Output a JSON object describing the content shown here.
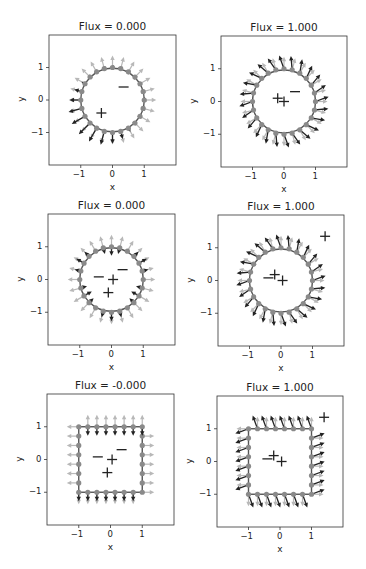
{
  "figure": {
    "background": "#ffffff",
    "colors": {
      "axes_frame": "#333333",
      "node": "#8a8a8a",
      "curve": "#555555",
      "arrow_dark": "#222222",
      "arrow_light": "#b8b8b8",
      "marker": "#222222"
    }
  },
  "chart_data": [
    {
      "type": "quiver",
      "title": "Flux = 0.000",
      "xlabel": "x",
      "ylabel": "y",
      "xlim": [
        -2,
        2
      ],
      "ylim": [
        -2,
        2
      ],
      "xticks": [
        -1,
        0,
        1
      ],
      "yticks": [
        -1,
        0,
        1
      ],
      "shape": "circle",
      "n_nodes": 24,
      "charges": [
        {
          "sign": "-",
          "x": 0.35,
          "y": 0.4
        },
        {
          "sign": "+",
          "x": -0.35,
          "y": -0.4
        }
      ],
      "flow": "dipole"
    },
    {
      "type": "quiver",
      "title": "Flux = 1.000",
      "xlabel": "x",
      "ylabel": "y",
      "xlim": [
        -2,
        2
      ],
      "ylim": [
        -2,
        2
      ],
      "xticks": [
        -1,
        0,
        1
      ],
      "yticks": [
        -1,
        0,
        1
      ],
      "shape": "circle",
      "n_nodes": 24,
      "charges": [
        {
          "sign": "-",
          "x": 0.35,
          "y": 0.3
        },
        {
          "sign": "+",
          "x": -0.2,
          "y": 0.1
        },
        {
          "sign": "+",
          "x": 0.0,
          "y": 0.0
        }
      ],
      "flow": "outward"
    },
    {
      "type": "quiver",
      "title": "Flux = 0.000",
      "xlabel": "x",
      "ylabel": "y",
      "xlim": [
        -2,
        2
      ],
      "ylim": [
        -2,
        2
      ],
      "xticks": [
        -1,
        0,
        1
      ],
      "yticks": [
        -1,
        0,
        1
      ],
      "shape": "circle",
      "n_nodes": 24,
      "charges": [
        {
          "sign": "-",
          "x": 0.35,
          "y": 0.3
        },
        {
          "sign": "-",
          "x": -0.4,
          "y": 0.08
        },
        {
          "sign": "+",
          "x": 0.05,
          "y": 0.0
        },
        {
          "sign": "+",
          "x": -0.1,
          "y": -0.4
        }
      ],
      "flow": "mixed"
    },
    {
      "type": "quiver",
      "title": "Flux = 1.000",
      "xlabel": "x",
      "ylabel": "y",
      "xlim": [
        -2,
        2
      ],
      "ylim": [
        -2,
        2
      ],
      "xticks": [
        -1,
        0,
        1
      ],
      "yticks": [
        -1,
        0,
        1
      ],
      "shape": "circle",
      "n_nodes": 24,
      "charges": [
        {
          "sign": "-",
          "x": -0.4,
          "y": 0.08
        },
        {
          "sign": "+",
          "x": -0.2,
          "y": 0.18
        },
        {
          "sign": "+",
          "x": 0.05,
          "y": 0.0
        },
        {
          "sign": "+",
          "x": 1.4,
          "y": 1.35
        }
      ],
      "flow": "outward"
    },
    {
      "type": "quiver",
      "title": "Flux = -0.000",
      "xlabel": "x",
      "ylabel": "y",
      "xlim": [
        -2,
        2
      ],
      "ylim": [
        -2,
        2
      ],
      "xticks": [
        -1,
        0,
        1
      ],
      "yticks": [
        -1,
        0,
        1
      ],
      "shape": "square",
      "n_nodes": 28,
      "charges": [
        {
          "sign": "-",
          "x": 0.35,
          "y": 0.3
        },
        {
          "sign": "-",
          "x": -0.4,
          "y": 0.08
        },
        {
          "sign": "+",
          "x": 0.05,
          "y": 0.0
        },
        {
          "sign": "+",
          "x": -0.1,
          "y": -0.4
        }
      ],
      "flow": "mixed"
    },
    {
      "type": "quiver",
      "title": "Flux = 1.000",
      "xlabel": "x",
      "ylabel": "y",
      "xlim": [
        -2,
        2
      ],
      "ylim": [
        -2,
        2
      ],
      "xticks": [
        -1,
        0,
        1
      ],
      "yticks": [
        -1,
        0,
        1
      ],
      "shape": "square",
      "n_nodes": 28,
      "charges": [
        {
          "sign": "-",
          "x": -0.4,
          "y": 0.08
        },
        {
          "sign": "+",
          "x": -0.2,
          "y": 0.18
        },
        {
          "sign": "+",
          "x": 0.05,
          "y": 0.0
        },
        {
          "sign": "+",
          "x": 1.4,
          "y": 1.35
        }
      ],
      "flow": "outward"
    }
  ],
  "layout": {
    "axes_boxes": [
      {
        "left": 49,
        "top": 35,
        "w": 127,
        "h": 130
      },
      {
        "left": 221,
        "top": 36,
        "w": 126,
        "h": 131
      },
      {
        "left": 48,
        "top": 214,
        "w": 127,
        "h": 131
      },
      {
        "left": 218,
        "top": 215,
        "w": 126,
        "h": 131
      },
      {
        "left": 47,
        "top": 394,
        "w": 127,
        "h": 131
      },
      {
        "left": 217,
        "top": 396,
        "w": 126,
        "h": 131
      }
    ]
  }
}
